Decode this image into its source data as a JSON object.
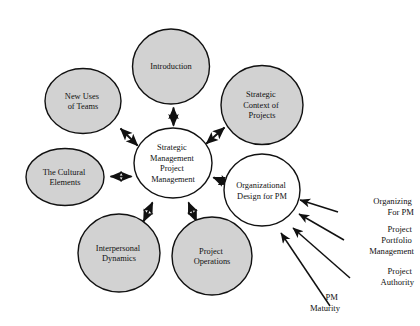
{
  "diagram": {
    "type": "hub-and-spoke concept map",
    "center_node": {
      "id": "strategic-management-project-management",
      "lines": [
        "Strategic",
        "Management",
        "Project",
        "Management"
      ],
      "fill": "#ffffff"
    },
    "satellite_nodes": [
      {
        "id": "introduction",
        "lines": [
          "Introduction"
        ],
        "fill": "#d2d2d2",
        "arrow": "double"
      },
      {
        "id": "strategic-context-of-projects",
        "lines": [
          "Strategic",
          "Context of",
          "Projects"
        ],
        "fill": "#d2d2d2",
        "arrow": "double"
      },
      {
        "id": "organizational-design-for-pm",
        "lines": [
          "Organizational",
          "Design for PM"
        ],
        "fill": "#ffffff",
        "arrow": "double"
      },
      {
        "id": "project-operations",
        "lines": [
          "Project",
          "Operations"
        ],
        "fill": "#d2d2d2",
        "arrow": "double"
      },
      {
        "id": "interpersonal-dynamics",
        "lines": [
          "Interpersonal",
          "Dynamics"
        ],
        "fill": "#d2d2d2",
        "arrow": "double"
      },
      {
        "id": "the-cultural-elements",
        "lines": [
          "The Cultural",
          "Elements"
        ],
        "fill": "#d2d2d2",
        "arrow": "double"
      },
      {
        "id": "new-uses-of-teams",
        "lines": [
          "New Uses",
          "of Teams"
        ],
        "fill": "#d2d2d2",
        "arrow": "double"
      }
    ],
    "input_labels": [
      {
        "id": "organizing-for-pm",
        "lines": [
          "Organizing",
          "For PM"
        ],
        "arrow": "single",
        "target": "organizational-design-for-pm"
      },
      {
        "id": "project-portfolio-management",
        "lines": [
          "Project",
          "Portfolio",
          "Management"
        ],
        "arrow": "single",
        "target": "organizational-design-for-pm"
      },
      {
        "id": "project-authority",
        "lines": [
          "Project",
          "Authority"
        ],
        "arrow": "single",
        "target": "organizational-design-for-pm"
      },
      {
        "id": "pm-maturity",
        "lines": [
          "PM",
          "Maturity"
        ],
        "arrow": "single",
        "target": "organizational-design-for-pm"
      }
    ],
    "colors": {
      "node_fill_gray": "#d2d2d2",
      "node_fill_white": "#ffffff",
      "stroke": "#111111",
      "background": "#ffffff"
    }
  }
}
